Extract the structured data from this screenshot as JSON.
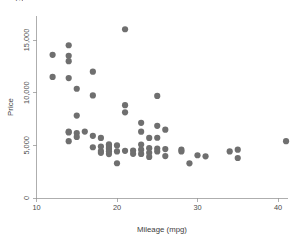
{
  "chart_data": {
    "type": "scatter",
    "title": "",
    "xlabel": "Mileage (mpg)",
    "ylabel": "Price",
    "xlim": [
      8.4,
      42.5
    ],
    "ylim": [
      0,
      16800
    ],
    "xticks": [
      10,
      20,
      30,
      40
    ],
    "xticklabels": [
      "10",
      "20",
      "30",
      "40"
    ],
    "yticks": [
      0,
      5000,
      10000,
      15000
    ],
    "yticklabels": [
      "0",
      "5,000",
      "10,000",
      "15,000"
    ],
    "grid": false,
    "legend": "none",
    "marker_color": "#6f6f6f",
    "marker_size": 3.1,
    "series": [
      {
        "name": "price vs mileage",
        "points": [
          [
            12,
            13594
          ],
          [
            12,
            11497
          ],
          [
            14,
            14500
          ],
          [
            14,
            13507
          ],
          [
            14,
            12990
          ],
          [
            14,
            11385
          ],
          [
            15,
            7827
          ],
          [
            14,
            6295
          ],
          [
            14,
            6229
          ],
          [
            14,
            5397
          ],
          [
            15,
            6165
          ],
          [
            15,
            5799
          ],
          [
            15,
            10372
          ],
          [
            16,
            6303
          ],
          [
            17,
            11995
          ],
          [
            17,
            9735
          ],
          [
            17,
            5899
          ],
          [
            17,
            4816
          ],
          [
            18,
            5705
          ],
          [
            18,
            4890
          ],
          [
            18,
            4453
          ],
          [
            18,
            4290
          ],
          [
            19,
            5104
          ],
          [
            19,
            4925
          ],
          [
            19,
            4749
          ],
          [
            19,
            4647
          ],
          [
            19,
            4425
          ],
          [
            19,
            4172
          ],
          [
            20,
            4995
          ],
          [
            20,
            4424
          ],
          [
            20,
            3299
          ],
          [
            21,
            16022
          ],
          [
            21,
            8814
          ],
          [
            21,
            8129
          ],
          [
            21,
            4482
          ],
          [
            22,
            4504
          ],
          [
            22,
            4195
          ],
          [
            23,
            7140
          ],
          [
            23,
            6295
          ],
          [
            23,
            5079
          ],
          [
            23,
            4589
          ],
          [
            23,
            4187
          ],
          [
            24,
            5705
          ],
          [
            24,
            4733
          ],
          [
            24,
            4296
          ],
          [
            24,
            3895
          ],
          [
            25,
            9690
          ],
          [
            25,
            6850
          ],
          [
            25,
            5719
          ],
          [
            25,
            4697
          ],
          [
            25,
            4425
          ],
          [
            26,
            6486
          ],
          [
            26,
            4647
          ],
          [
            26,
            3984
          ],
          [
            28,
            4589
          ],
          [
            28,
            4425
          ],
          [
            29,
            3291
          ],
          [
            30,
            4060
          ],
          [
            31,
            3955
          ],
          [
            34,
            4425
          ],
          [
            35,
            4589
          ],
          [
            35,
            3798
          ],
          [
            41,
            5397
          ]
        ]
      }
    ]
  },
  "clipped_header": "15"
}
